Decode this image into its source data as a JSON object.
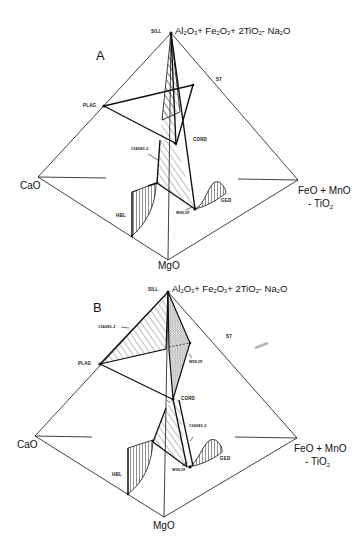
{
  "figure": {
    "panels": [
      {
        "id": "A",
        "label": "A",
        "vertices": {
          "apex": "Al2O3 + Fe2O3 + 2TiO2 - Na2O",
          "left": "CaO",
          "right_line1": "FeO + MnO",
          "right_line2": "- TiO2",
          "bottom": "MgO"
        },
        "phases": {
          "sill": "SILL",
          "st": "ST",
          "plag": "PLAG",
          "cord": "CORD",
          "ged": "GED",
          "hbl": "HBL"
        },
        "samples": {
          "sample1": "134083-2",
          "sample2": "W95JX"
        }
      },
      {
        "id": "B",
        "label": "B",
        "vertices": {
          "apex": "Al2O3 + Fe2O3 + 2TiO2 - Na2O",
          "left": "CaO",
          "right_line1": "FeO + MnO",
          "right_line2": "- TiO2",
          "bottom": "MgO"
        },
        "phases": {
          "sill": "SILL",
          "st": "ST",
          "plag": "PLAG",
          "cord": "CORD",
          "ged": "GED",
          "hbl": "HBL"
        },
        "samples": {
          "sample1_upper": "134083-2",
          "sample2_upper": "W95JX",
          "sample1_lower": "134083-2",
          "sample2_lower": "W95JX"
        }
      }
    ]
  }
}
